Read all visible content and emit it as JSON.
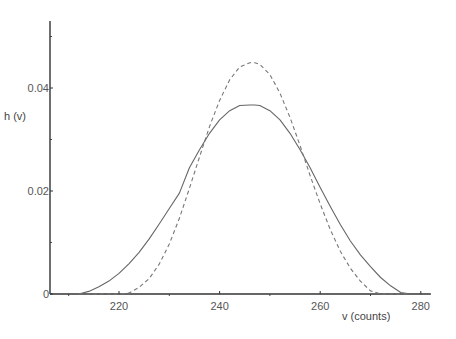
{
  "chart_data": {
    "type": "line",
    "title": "",
    "xlabel": "v (counts)",
    "ylabel": "h (v)",
    "xlim": [
      206.5,
      282
    ],
    "ylim": [
      0,
      0.053
    ],
    "grid": false,
    "legend": null,
    "x_ticks": [
      {
        "value": 220,
        "label": "220"
      },
      {
        "value": 240,
        "label": "240"
      },
      {
        "value": 260,
        "label": "260"
      },
      {
        "value": 280,
        "label": "280"
      }
    ],
    "x_minor_ticks": [
      210,
      230,
      250,
      270
    ],
    "y_ticks": [
      {
        "value": 0,
        "label": "0"
      },
      {
        "value": 0.02,
        "label": "0.02"
      },
      {
        "value": 0.04,
        "label": "0.04"
      }
    ],
    "y_minor_ticks": [
      0.01,
      0.03,
      0.05
    ],
    "x": [
      212,
      214,
      216,
      218,
      220,
      222,
      224,
      226,
      228,
      230,
      232,
      234,
      236,
      238,
      240,
      242,
      244,
      246,
      247,
      248,
      250,
      252,
      254,
      256,
      258,
      260,
      262,
      264,
      266,
      268,
      270,
      272,
      274,
      276,
      278
    ],
    "series": [
      {
        "name": "solid",
        "style": "solid",
        "color": "#666666",
        "values": [
          0.0,
          0.0005,
          0.0014,
          0.0025,
          0.004,
          0.0059,
          0.0081,
          0.0107,
          0.0136,
          0.0166,
          0.0196,
          0.0245,
          0.028,
          0.0312,
          0.0338,
          0.0356,
          0.0366,
          0.0367,
          0.0367,
          0.0366,
          0.0356,
          0.0338,
          0.0312,
          0.028,
          0.0245,
          0.0207,
          0.017,
          0.0135,
          0.0103,
          0.0076,
          0.0053,
          0.0032,
          0.0016,
          0.0003,
          0.0
        ]
      },
      {
        "name": "dashed",
        "style": "dashed",
        "color": "#777777",
        "values": [
          0.0,
          0.0,
          0.0,
          0.0,
          0.0,
          0.0002,
          0.0013,
          0.003,
          0.0058,
          0.0097,
          0.0147,
          0.0205,
          0.0266,
          0.0325,
          0.0376,
          0.0416,
          0.0441,
          0.0449,
          0.0449,
          0.0446,
          0.0426,
          0.039,
          0.0343,
          0.0288,
          0.023,
          0.0175,
          0.0125,
          0.0083,
          0.005,
          0.0025,
          0.0006,
          0.0,
          0.0,
          0.0,
          0.0
        ]
      }
    ]
  }
}
